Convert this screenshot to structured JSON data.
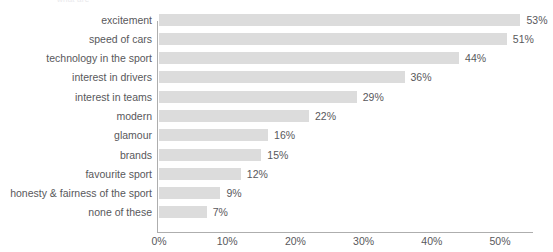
{
  "clipped_title": "what are",
  "colors": {
    "bar": "#dcdcdc",
    "text": "#58585b",
    "axis": "#aeaeae",
    "background": "#ffffff"
  },
  "chart_data": {
    "type": "bar",
    "orientation": "horizontal",
    "title": "",
    "xlabel": "",
    "ylabel": "",
    "grid": false,
    "legend": false,
    "xlim": [
      0,
      57
    ],
    "xticks": [
      "0%",
      "10%",
      "20%",
      "30%",
      "40%",
      "50%"
    ],
    "xtick_values": [
      0,
      10,
      20,
      30,
      40,
      50
    ],
    "value_suffix": "%",
    "categories": [
      "excitement",
      "speed of cars",
      "technology in the sport",
      "interest in drivers",
      "interest in teams",
      "modern",
      "glamour",
      "brands",
      "favourite sport",
      "honesty & fairness of the sport",
      "none of these"
    ],
    "values": [
      53,
      51,
      44,
      36,
      29,
      22,
      16,
      15,
      12,
      9,
      7
    ],
    "value_labels": [
      "53%",
      "51%",
      "44%",
      "36%",
      "29%",
      "22%",
      "16%",
      "15%",
      "12%",
      "9%",
      "7%"
    ]
  }
}
